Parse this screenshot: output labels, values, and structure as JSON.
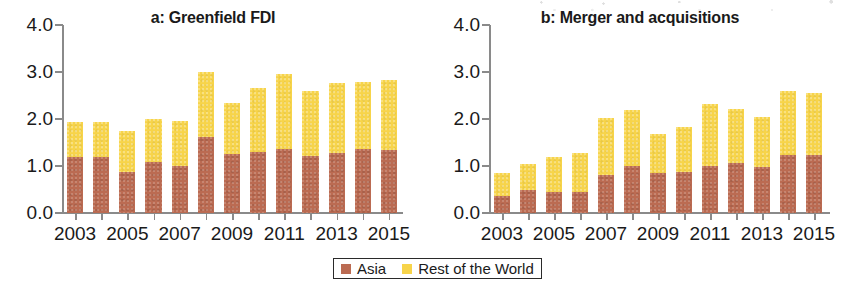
{
  "colors": {
    "asia": "#bb6b52",
    "rest_of_world": "#f7d44a",
    "axis": "#8a8a8a",
    "text": "#1a1a1a"
  },
  "legend": {
    "entries": [
      {
        "label": "Asia",
        "color": "#bb6b52"
      },
      {
        "label": "Rest of the World",
        "color": "#f7d44a"
      }
    ]
  },
  "chart_data": [
    {
      "type": "bar",
      "stacked": true,
      "panel": "a",
      "title": "a: Greenfield FDI",
      "xlabel": "",
      "ylabel": "",
      "ylim": [
        0.0,
        4.0
      ],
      "yticks": [
        "0.0",
        "1.0",
        "2.0",
        "3.0",
        "4.0"
      ],
      "ytick_values": [
        0.0,
        1.0,
        2.0,
        3.0,
        4.0
      ],
      "grid": false,
      "legend_position": "bottom-center",
      "categories": [
        2003,
        2004,
        2005,
        2006,
        2007,
        2008,
        2009,
        2010,
        2011,
        2012,
        2013,
        2014,
        2015
      ],
      "xtick_labels": [
        "2003",
        "",
        "2005",
        "",
        "2007",
        "",
        "2009",
        "",
        "2011",
        "",
        "2013",
        "",
        "2015"
      ],
      "series": [
        {
          "name": "Asia",
          "color": "#bb6b52",
          "values": [
            1.2,
            1.19,
            0.87,
            1.08,
            1.01,
            1.62,
            1.26,
            1.3,
            1.37,
            1.21,
            1.28,
            1.37,
            1.34
          ]
        },
        {
          "name": "Rest of the World",
          "color": "#f7d44a",
          "values": [
            0.73,
            0.74,
            0.88,
            0.93,
            0.95,
            1.39,
            1.09,
            1.37,
            1.58,
            1.39,
            1.49,
            1.42,
            1.5
          ]
        }
      ],
      "totals": [
        1.93,
        1.93,
        1.75,
        2.01,
        1.96,
        3.01,
        2.35,
        2.67,
        2.95,
        2.6,
        2.77,
        2.79,
        2.84
      ]
    },
    {
      "type": "bar",
      "stacked": true,
      "panel": "b",
      "title": "b: Merger and acquisitions",
      "xlabel": "",
      "ylabel": "",
      "ylim": [
        0.0,
        4.0
      ],
      "yticks": [
        "0.0",
        "1.0",
        "2.0",
        "3.0",
        "4.0"
      ],
      "ytick_values": [
        0.0,
        1.0,
        2.0,
        3.0,
        4.0
      ],
      "grid": false,
      "legend_position": "bottom-center",
      "categories": [
        2003,
        2004,
        2005,
        2006,
        2007,
        2008,
        2009,
        2010,
        2011,
        2012,
        2013,
        2014,
        2015
      ],
      "xtick_labels": [
        "2003",
        "",
        "2005",
        "",
        "2007",
        "",
        "2009",
        "",
        "2011",
        "",
        "2013",
        "",
        "2015"
      ],
      "series": [
        {
          "name": "Asia",
          "color": "#bb6b52",
          "values": [
            0.37,
            0.5,
            0.45,
            0.45,
            0.8,
            0.99,
            0.86,
            0.87,
            1.01,
            1.06,
            0.97,
            1.23,
            1.23
          ]
        },
        {
          "name": "Rest of the World",
          "color": "#f7d44a",
          "values": [
            0.48,
            0.54,
            0.74,
            0.83,
            1.22,
            1.2,
            0.83,
            0.96,
            1.32,
            1.15,
            1.07,
            1.36,
            1.32
          ]
        }
      ],
      "totals": [
        0.85,
        1.04,
        1.19,
        1.28,
        2.02,
        2.19,
        1.69,
        1.83,
        2.33,
        2.21,
        2.04,
        2.59,
        2.55
      ]
    }
  ]
}
